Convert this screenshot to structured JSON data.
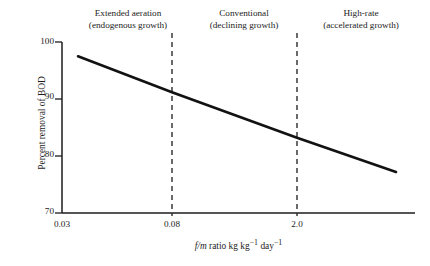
{
  "chart_data": {
    "type": "line",
    "title": "",
    "xlabel": "f/m ratio kg kg−1 day−1",
    "ylabel": "Percent removal of BOD",
    "ylim": [
      70,
      100
    ],
    "yticks": [
      100,
      90,
      80,
      70
    ],
    "ytick_labels": [
      "100",
      "90",
      "80",
      "70"
    ],
    "xtick_labels": [
      "0.03",
      "0.08",
      "2.0"
    ],
    "xtick_positions_px": [
      62,
      172,
      297
    ],
    "grid": false,
    "legend": "none",
    "series": [
      {
        "name": "BOD removal vs f/m ratio",
        "points": [
          {
            "x_label": "0.03",
            "x_px": 78,
            "y": 97.5
          },
          {
            "x_label": "0.08",
            "x_px": 172,
            "y": 91.2
          },
          {
            "x_label": "2.0",
            "x_px": 297,
            "y": 83.2
          },
          {
            "x_label": "",
            "x_px": 396,
            "y": 77.2
          }
        ],
        "color": "#121212",
        "line_width_px": 2.6
      }
    ],
    "dividers": [
      {
        "x_label": "0.08",
        "x_px": 172,
        "style": "dashed",
        "color": "#2b2b2b"
      },
      {
        "x_label": "2.0",
        "x_px": 297,
        "style": "dashed",
        "color": "#2b2b2b"
      }
    ],
    "annotations": [
      {
        "line1": "Extended aeration",
        "line2": "(endogenous growth)"
      },
      {
        "line1": "Conventional",
        "line2": "(declining growth)"
      },
      {
        "line1": "High-rate",
        "line2": "(accelerated growth)"
      }
    ]
  },
  "axes": {
    "y_title": "Percent removal of BOD",
    "x_title_prefix": "f/m",
    "x_title_rest": " ratio kg kg",
    "x_title_sup1": "−1",
    "x_title_mid": " day",
    "x_title_sup2": "−1",
    "ytick_100": "100",
    "ytick_90": "90",
    "ytick_80": "80",
    "ytick_70": "70",
    "xtick_1": "0.03",
    "xtick_2": "0.08",
    "xtick_3": "2.0"
  },
  "regions": {
    "extended_aeration": {
      "line1": "Extended aeration",
      "line2": "(endogenous growth)"
    },
    "conventional": {
      "line1": "Conventional",
      "line2": "(declining growth)"
    },
    "high_rate": {
      "line1": "High-rate",
      "line2": "(accelerated growth)"
    }
  },
  "colors": {
    "background": "#ffffff",
    "ink": "#1c1c1c",
    "data_line": "#121212",
    "divider": "#2b2b2b"
  }
}
